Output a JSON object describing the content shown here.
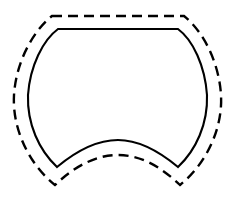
{
  "figure": {
    "background_color": "#ffffff",
    "stroke_color": "#000000",
    "canvas": {
      "width": 238,
      "height": 199
    }
  },
  "shapes": [
    {
      "id": "inner-solid-contour",
      "name": "solid-outline",
      "style": "solid",
      "stroke_color": "#000000",
      "stroke_width": 2.1,
      "fill": "none",
      "key_points": {
        "top_left_corner": [
          58,
          29
        ],
        "top_right_corner": [
          178,
          29
        ],
        "left_widest": [
          27,
          95
        ],
        "right_widest": [
          207,
          95
        ],
        "bottom_left_cusp": [
          57,
          167
        ],
        "bottom_right_cusp": [
          178,
          167
        ],
        "bottom_arc_peak": [
          118,
          140
        ]
      },
      "path": "M 58 29 L 178 29 C 193 40 205 66 207 95 C 208 124 196 150 178 167 C 160 152 140 140 118 140 C 96 140 75 152 57 167 C 39 150 27 124 28 95 C 30 66 43 40 58 29 Z"
    },
    {
      "id": "outer-dashed-contour",
      "name": "dashed-outline",
      "style": "dashed",
      "stroke_color": "#000000",
      "stroke_width": 2.4,
      "fill": "none",
      "dash_pattern": [
        10,
        6
      ],
      "key_points": {
        "top_left_corner": [
          52,
          16
        ],
        "top_right_corner": [
          184,
          16
        ],
        "left_widest": [
          14,
          95
        ],
        "right_widest": [
          221,
          95
        ],
        "bottom_left_cusp": [
          55,
          185
        ],
        "bottom_right_cusp": [
          180,
          185
        ],
        "bottom_arc_peak": [
          118,
          155
        ]
      },
      "path": "M 52 16 L 184 16 C 203 31 219 62 221 95 C 223 130 205 165 180 185 C 161 167 141 155 118 155 C 95 155 74 167 55 185 C 30 165 12 130 14 95 C 16 62 33 31 52 16 Z"
    }
  ]
}
